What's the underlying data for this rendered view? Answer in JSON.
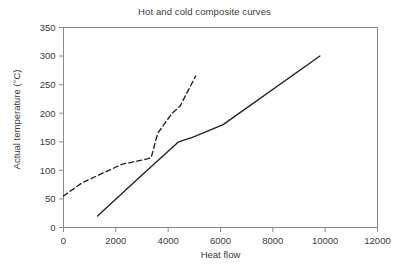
{
  "chart_data": {
    "type": "line",
    "title": "Hot and cold composite curves",
    "xlabel": "Heat flow",
    "ylabel": "Actual temperature (°C)",
    "xlim": [
      0,
      12000
    ],
    "ylim": [
      0,
      350
    ],
    "xticks": [
      0,
      2000,
      4000,
      6000,
      8000,
      10000,
      12000
    ],
    "yticks": [
      0,
      50,
      100,
      150,
      200,
      250,
      300,
      350
    ],
    "xtick_labels": [
      "0",
      "2000",
      "4000",
      "6000",
      "8000",
      "10000",
      "12000"
    ],
    "ytick_labels": [
      "0",
      "50",
      "100",
      "150",
      "200",
      "250",
      "300",
      "350"
    ],
    "grid": false,
    "legend": "none",
    "series": [
      {
        "name": "Cold composite curve",
        "style": "dashed",
        "color": "#231f20",
        "points": [
          [
            0,
            55
          ],
          [
            700,
            78
          ],
          [
            1500,
            95
          ],
          [
            2250,
            111
          ],
          [
            2700,
            115
          ],
          [
            3200,
            120
          ],
          [
            3350,
            122
          ],
          [
            3600,
            165
          ],
          [
            4150,
            200
          ],
          [
            4450,
            212
          ],
          [
            5050,
            265
          ]
        ]
      },
      {
        "name": "Hot composite curve",
        "style": "solid",
        "color": "#231f20",
        "points": [
          [
            1300,
            20
          ],
          [
            3000,
            92
          ],
          [
            4400,
            150
          ],
          [
            4950,
            158
          ],
          [
            6100,
            180
          ],
          [
            9800,
            300
          ]
        ]
      }
    ]
  },
  "colors": {
    "axis": "#8a8a8a",
    "curve": "#231f20",
    "text": "#3a3a3a",
    "background": "#ffffff"
  }
}
